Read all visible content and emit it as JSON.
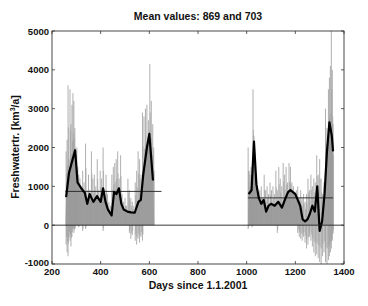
{
  "chart_data": {
    "type": "bar",
    "title": "Mean values: 869 and 703",
    "xlabel": "Days since 1.1.2001",
    "ylabel": "Freshwatertr. [km³/a]",
    "ylabel_parts": {
      "pre": "Freshwatertr. [km",
      "sup": "3",
      "post": "/a]"
    },
    "xlim": [
      200,
      1400
    ],
    "ylim": [
      -1000,
      5000
    ],
    "xticks": [
      200,
      400,
      600,
      800,
      1000,
      1200,
      1400
    ],
    "yticks": [
      -1000,
      0,
      1000,
      2000,
      3000,
      4000,
      5000
    ],
    "grid": false,
    "legend": null,
    "colors": {
      "raw": "#9a9a9a",
      "fill": "#a6a6a6",
      "smooth": "#000000",
      "mean": "#222222",
      "axis": "#333333"
    },
    "segments": [
      {
        "name": "period-1",
        "x_range": [
          255,
          620
        ],
        "mean": 869,
        "mean_line_x": [
          255,
          650
        ],
        "smoothed": {
          "x": [
            258,
            270,
            285,
            295,
            305,
            320,
            335,
            345,
            355,
            370,
            385,
            400,
            410,
            420,
            430,
            445,
            455,
            465,
            475,
            485,
            495,
            510,
            525,
            540,
            555,
            565,
            575,
            590,
            600,
            615
          ],
          "y": [
            720,
            1350,
            1700,
            1930,
            1100,
            950,
            830,
            550,
            800,
            600,
            750,
            600,
            950,
            600,
            400,
            250,
            850,
            800,
            950,
            550,
            400,
            350,
            330,
            320,
            600,
            650,
            1300,
            2000,
            2350,
            1150
          ]
        },
        "raw_spikes": {
          "x": [
            258,
            262,
            266,
            270,
            274,
            278,
            282,
            286,
            290,
            294,
            298,
            302,
            306,
            310,
            315,
            320,
            326,
            332,
            338,
            344,
            350,
            356,
            362,
            368,
            374,
            380,
            386,
            392,
            398,
            404,
            410,
            416,
            422,
            428,
            434,
            440,
            446,
            452,
            458,
            464,
            470,
            476,
            482,
            488,
            494,
            500,
            506,
            512,
            518,
            524,
            530,
            536,
            542,
            548,
            554,
            560,
            566,
            572,
            578,
            584,
            590,
            596,
            602,
            608,
            614,
            618
          ],
          "hi": [
            1900,
            2200,
            3600,
            1700,
            3500,
            2600,
            3100,
            3400,
            3200,
            2500,
            1800,
            2000,
            1500,
            1300,
            1200,
            1000,
            1400,
            1100,
            2100,
            900,
            1300,
            900,
            1900,
            1200,
            1300,
            1000,
            1700,
            900,
            1400,
            1200,
            2000,
            900,
            1300,
            800,
            600,
            500,
            1300,
            1500,
            1600,
            1700,
            1900,
            1200,
            1800,
            800,
            600,
            700,
            500,
            1200,
            900,
            700,
            600,
            500,
            1100,
            1400,
            1900,
            1700,
            1300,
            2900,
            2800,
            3000,
            3100,
            2700,
            4150,
            3200,
            2600,
            2000
          ],
          "lo": [
            -500,
            -700,
            -800,
            -300,
            -400,
            -550,
            -300,
            -100,
            -200,
            -100,
            0,
            0,
            0,
            -50,
            0,
            0,
            -150,
            0,
            -100,
            0,
            0,
            0,
            0,
            0,
            0,
            0,
            0,
            0,
            0,
            0,
            -150,
            0,
            0,
            0,
            0,
            0,
            0,
            0,
            0,
            0,
            0,
            0,
            0,
            0,
            0,
            0,
            0,
            0,
            -200,
            -350,
            -250,
            0,
            -400,
            -500,
            -350,
            -450,
            -300,
            -400,
            0,
            0,
            0,
            0,
            0,
            0,
            0,
            0
          ]
        }
      },
      {
        "name": "period-2",
        "x_range": [
          1005,
          1355
        ],
        "mean": 703,
        "mean_line_x": [
          1005,
          1355
        ],
        "smoothed": {
          "x": [
            1008,
            1020,
            1030,
            1040,
            1050,
            1060,
            1070,
            1080,
            1090,
            1100,
            1115,
            1130,
            1145,
            1160,
            1170,
            1180,
            1190,
            1200,
            1210,
            1220,
            1230,
            1240,
            1250,
            1260,
            1270,
            1280,
            1290,
            1300,
            1310,
            1320,
            1330,
            1340,
            1350,
            1355
          ],
          "y": [
            800,
            900,
            2150,
            1050,
            700,
            550,
            650,
            350,
            500,
            550,
            500,
            600,
            450,
            700,
            850,
            900,
            850,
            800,
            650,
            500,
            150,
            100,
            150,
            300,
            500,
            350,
            1000,
            -150,
            100,
            800,
            1900,
            2650,
            2300,
            1900
          ]
        },
        "raw_spikes": {
          "x": [
            1006,
            1010,
            1014,
            1018,
            1022,
            1026,
            1030,
            1034,
            1038,
            1042,
            1048,
            1054,
            1060,
            1066,
            1072,
            1078,
            1084,
            1090,
            1096,
            1102,
            1108,
            1114,
            1120,
            1126,
            1132,
            1138,
            1144,
            1150,
            1156,
            1162,
            1168,
            1174,
            1180,
            1186,
            1192,
            1198,
            1204,
            1210,
            1216,
            1222,
            1228,
            1234,
            1240,
            1246,
            1252,
            1258,
            1264,
            1270,
            1276,
            1282,
            1288,
            1294,
            1300,
            1306,
            1312,
            1318,
            1324,
            1330,
            1336,
            1340,
            1344,
            1348,
            1352,
            1355
          ],
          "hi": [
            2000,
            1400,
            1300,
            1500,
            1200,
            3500,
            2300,
            1600,
            1300,
            1100,
            800,
            900,
            1000,
            700,
            1300,
            900,
            1000,
            800,
            1100,
            900,
            1000,
            800,
            1400,
            900,
            1500,
            1200,
            1000,
            1600,
            1300,
            1500,
            1100,
            1600,
            1500,
            1100,
            1000,
            800,
            900,
            1000,
            700,
            900,
            700,
            800,
            600,
            800,
            1200,
            900,
            1300,
            1000,
            1200,
            1100,
            1800,
            1300,
            1700,
            1200,
            800,
            1100,
            3000,
            2500,
            3500,
            3800,
            4100,
            5000,
            4000,
            2600
          ],
          "lo": [
            -100,
            0,
            0,
            0,
            -50,
            0,
            0,
            0,
            0,
            0,
            0,
            0,
            0,
            0,
            0,
            0,
            0,
            0,
            0,
            0,
            0,
            0,
            0,
            -200,
            0,
            0,
            0,
            0,
            0,
            0,
            0,
            0,
            0,
            0,
            0,
            0,
            0,
            -200,
            -300,
            -350,
            -400,
            -300,
            -450,
            -600,
            -500,
            -300,
            -400,
            -550,
            -700,
            -800,
            -750,
            -850,
            -950,
            -1000,
            -800,
            -700,
            -950,
            -1000,
            -900,
            -800,
            -700,
            -600,
            -400,
            -200
          ]
        }
      }
    ],
    "zero_line": {
      "y": 0,
      "x": [
        200,
        1400
      ]
    }
  }
}
